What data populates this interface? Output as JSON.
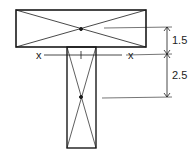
{
  "diagram": {
    "axis_label_left": "x",
    "axis_label_right": "x",
    "dimensions": [
      {
        "label": "1.5",
        "description": "flange centroid to x-x axis"
      },
      {
        "label": "2.5",
        "description": "x-x axis to web centroid"
      }
    ],
    "stroke_color": "#1a1a1a"
  }
}
